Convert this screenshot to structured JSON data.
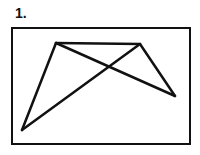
{
  "figure": {
    "label": "1.",
    "frame": {
      "x": 12,
      "y": 28,
      "width": 178,
      "height": 116
    },
    "stroke_color": "#111111",
    "line_width": 2.5,
    "vertices": {
      "top_left": [
        56,
        43
      ],
      "top_right": [
        140,
        44
      ],
      "right": [
        175,
        96
      ],
      "bottom_left": [
        22,
        130
      ]
    },
    "segments": [
      {
        "from": "top_left",
        "to": "top_right"
      },
      {
        "from": "top_left",
        "to": "bottom_left"
      },
      {
        "from": "bottom_left",
        "to": "top_right"
      },
      {
        "from": "top_left",
        "to": "right"
      },
      {
        "from": "top_right",
        "to": "right"
      }
    ]
  }
}
